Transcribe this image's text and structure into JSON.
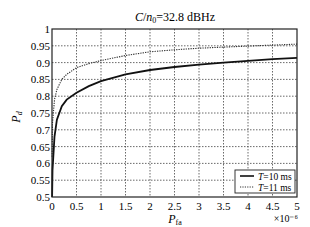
{
  "chart_data": {
    "type": "line",
    "title_parts": {
      "c": "C",
      "slash": "/",
      "n": "n",
      "sub": "0",
      "rest": "=32.8 dBHz"
    },
    "xlabel": "P_fa",
    "xlabel_parts": {
      "main": "P",
      "sub": "fa"
    },
    "ylabel": "P_d",
    "ylabel_parts": {
      "main": "P",
      "sub": "d"
    },
    "x_multiplier": "×10⁻⁶",
    "xlim": [
      0,
      5
    ],
    "ylim": [
      0.5,
      1
    ],
    "xticks": [
      0,
      0.5,
      1,
      1.5,
      2,
      2.5,
      3,
      3.5,
      4,
      4.5,
      5
    ],
    "xtick_labels": [
      "0",
      "0.5",
      "1",
      "1.5",
      "2",
      "2.5",
      "3",
      "3.5",
      "4",
      "4.5",
      "5"
    ],
    "yticks": [
      0.5,
      0.55,
      0.6,
      0.65,
      0.7,
      0.75,
      0.8,
      0.85,
      0.9,
      0.95,
      1
    ],
    "ytick_labels": [
      "0.5",
      "0.55",
      "0.6",
      "0.65",
      "0.7",
      "0.75",
      "0.8",
      "0.85",
      "0.9",
      "0.95",
      "1"
    ],
    "grid": true,
    "legend_position": "lower right",
    "series": [
      {
        "name": "T=10 ms",
        "style": "solid",
        "x": [
          0.01,
          0.05,
          0.1,
          0.2,
          0.3,
          0.5,
          0.75,
          1,
          1.5,
          2,
          2.5,
          3,
          3.5,
          4,
          4.5,
          5
        ],
        "values": [
          0.58,
          0.68,
          0.73,
          0.77,
          0.79,
          0.81,
          0.83,
          0.845,
          0.865,
          0.878,
          0.887,
          0.894,
          0.9,
          0.905,
          0.91,
          0.914
        ]
      },
      {
        "name": "T=11 ms",
        "style": "dotted",
        "x": [
          0.01,
          0.05,
          0.1,
          0.2,
          0.3,
          0.5,
          0.75,
          1,
          1.5,
          2,
          2.5,
          3,
          3.5,
          4,
          4.5,
          5
        ],
        "values": [
          0.72,
          0.79,
          0.82,
          0.85,
          0.865,
          0.885,
          0.897,
          0.906,
          0.921,
          0.932,
          0.938,
          0.943,
          0.946,
          0.949,
          0.952,
          0.955
        ]
      }
    ]
  },
  "legend": {
    "items": [
      {
        "prefix": "T",
        "label": "=10 ms",
        "style": "solid"
      },
      {
        "prefix": "T",
        "label": "=11 ms",
        "style": "dotted"
      }
    ]
  }
}
